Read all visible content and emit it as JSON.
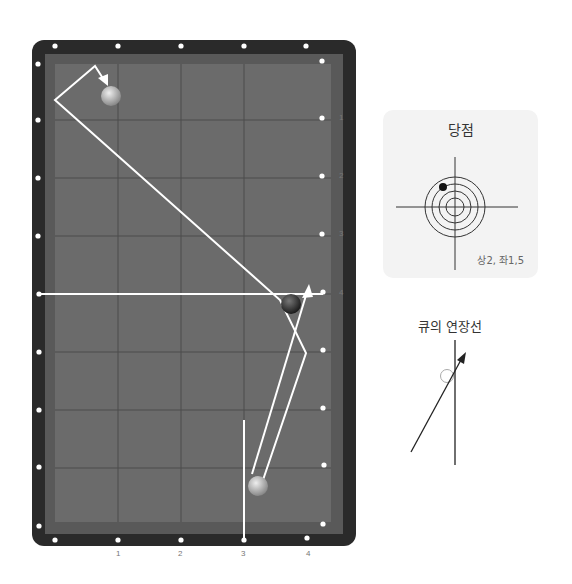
{
  "table": {
    "rail_labels_right": [
      "1",
      "2",
      "3",
      "4"
    ],
    "rail_labels_bottom": [
      "1",
      "2",
      "3",
      "4"
    ]
  },
  "aim_point": {
    "title": "당점",
    "value": "상2, 좌1,5"
  },
  "cue_extension": {
    "title": "큐의 연장선"
  },
  "colors": {
    "cloth": "#6b6b6b",
    "rail": "#2a2a2a",
    "path": "#ffffff"
  }
}
